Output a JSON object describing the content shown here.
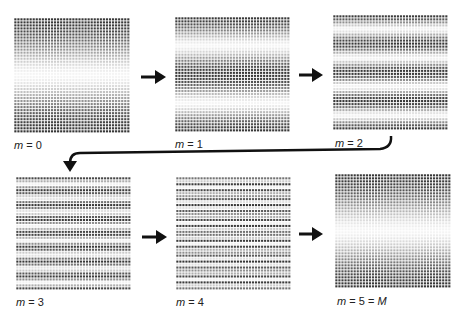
{
  "figure": {
    "grid": {
      "cols": 38,
      "rows": 38,
      "dot_color": "#3a3a3a"
    },
    "panels": [
      {
        "id": "m0",
        "label_var": "m",
        "label_rest": " = 0",
        "x": 14,
        "y": 18,
        "w": 116,
        "h": 115,
        "fringes": 1,
        "label_x": 14,
        "label_y": 139
      },
      {
        "id": "m1",
        "label_var": "m",
        "label_rest": " = 1",
        "x": 175,
        "y": 17,
        "w": 115,
        "h": 115,
        "fringes": 2,
        "label_x": 175,
        "label_y": 138
      },
      {
        "id": "m2",
        "label_var": "m",
        "label_rest": " = 2",
        "x": 333,
        "y": 15,
        "w": 115,
        "h": 115,
        "fringes": 4,
        "label_x": 335,
        "label_y": 137
      },
      {
        "id": "m3",
        "label_var": "m",
        "label_rest": " = 3",
        "x": 16,
        "y": 177,
        "w": 115,
        "h": 113,
        "fringes": 8,
        "label_x": 16,
        "label_y": 296
      },
      {
        "id": "m4",
        "label_var": "m",
        "label_rest": " = 4",
        "x": 176,
        "y": 177,
        "w": 115,
        "h": 113,
        "fringes": 16,
        "label_x": 176,
        "label_y": 296
      },
      {
        "id": "m5",
        "label_var": "m",
        "label_rest": " = 5 = ",
        "label_var2": "M",
        "x": 335,
        "y": 174,
        "w": 116,
        "h": 114,
        "fringes": 1,
        "label_x": 337,
        "label_y": 295
      }
    ],
    "arrows": [
      {
        "from": "m0",
        "to": "m1",
        "x1": 141,
        "y1": 77,
        "x2": 165,
        "y2": 77
      },
      {
        "from": "m1",
        "to": "m2",
        "x1": 299,
        "y1": 75,
        "x2": 322,
        "y2": 75
      },
      {
        "from": "m3",
        "to": "m4",
        "x1": 142,
        "y1": 237,
        "x2": 166,
        "y2": 237
      },
      {
        "from": "m4",
        "to": "m5",
        "x1": 299,
        "y1": 234,
        "x2": 322,
        "y2": 234
      }
    ],
    "wrap_arrow": {
      "from": "m2",
      "to": "m3"
    }
  }
}
